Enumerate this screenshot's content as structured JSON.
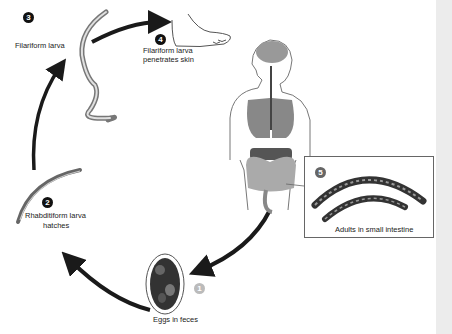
{
  "diagram": {
    "type": "life-cycle",
    "stages": [
      {
        "number": "1",
        "label": "Eggs in feces"
      },
      {
        "number": "2",
        "label_line1": "Rhabditiform larva",
        "label_line2": "hatches"
      },
      {
        "number": "3",
        "label": "Filariform larva"
      },
      {
        "number": "4",
        "label_line1": "Filariform larva",
        "label_line2": "penetrates skin"
      },
      {
        "number": "5",
        "label": "Adults in small intestine"
      }
    ],
    "colors": {
      "arrow": "#1a1a1a",
      "organ_grey": "#8a8a8a",
      "outline": "#555555",
      "background": "#ffffff",
      "side_strip": "#ececec"
    }
  }
}
